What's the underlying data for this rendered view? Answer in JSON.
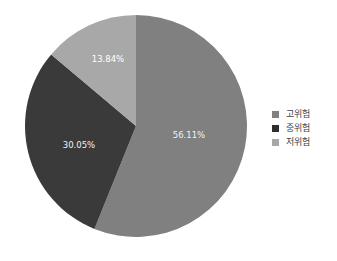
{
  "chart_data": {
    "type": "pie",
    "title": "",
    "categories": [
      "고위험",
      "중위험",
      "저위험"
    ],
    "values": [
      56.11,
      30.05,
      13.84
    ],
    "value_labels": [
      "56.11%",
      "30.05%",
      "13.84%"
    ],
    "colors": [
      "#808080",
      "#3a3a3a",
      "#a8a8a8"
    ],
    "legend_position": "right",
    "start_angle_deg": 0,
    "direction": "clockwise",
    "labels_inside": true,
    "background_color": "#ffffff",
    "label_text_color": "#f2f2f2",
    "legend_text_color": "#3f3f3f",
    "center": {
      "x": 136,
      "y": 126
    },
    "radius": 111,
    "slices": [
      {
        "name": "고위험",
        "value": 56.11,
        "label": "56.11%",
        "color": "#808080",
        "legend_swatch_color": "#808080",
        "label_x": 189,
        "label_y": 135
      },
      {
        "name": "중위험",
        "value": 30.05,
        "label": "30.05%",
        "color": "#3a3a3a",
        "legend_swatch_color": "#2e2e2e",
        "label_x": 79,
        "label_y": 145
      },
      {
        "name": "저위험",
        "value": 13.84,
        "label": "13.84%",
        "color": "#a8a8a8",
        "legend_swatch_color": "#a8a8a8",
        "label_x": 108,
        "label_y": 59
      }
    ]
  },
  "legend": {
    "items": [
      {
        "label": "고위험",
        "color": "#808080"
      },
      {
        "label": "중위험",
        "color": "#2e2e2e"
      },
      {
        "label": "저위험",
        "color": "#a8a8a8"
      }
    ]
  }
}
